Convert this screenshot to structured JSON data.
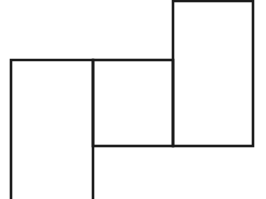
{
  "diagram": {
    "width": 266,
    "height": 199,
    "background": "#ffffff",
    "stroke_color": "#1a1a1a",
    "stroke_width": 2.6,
    "shapes": [
      {
        "name": "left-rectangle",
        "x1": 11,
        "y1": 60,
        "x2": 93,
        "y2": 199,
        "open_bottom": true
      },
      {
        "name": "middle-square",
        "x1": 93,
        "y1": 60,
        "x2": 173,
        "y2": 146
      },
      {
        "name": "right-tall-rectangle",
        "x1": 173,
        "y1": 1,
        "x2": 253,
        "y2": 146
      }
    ],
    "labels": []
  }
}
